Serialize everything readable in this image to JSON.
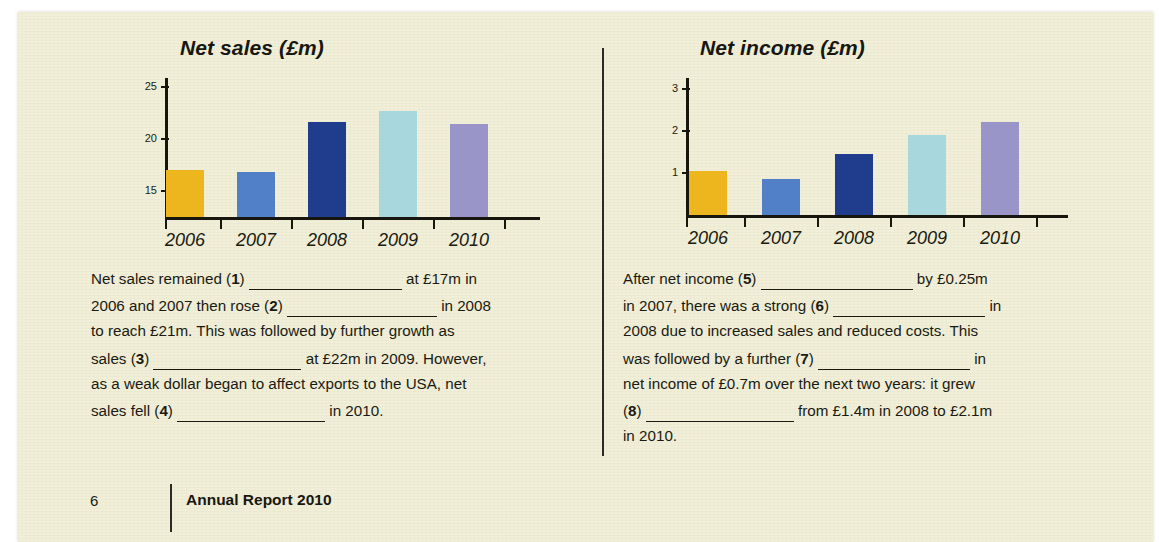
{
  "page": {
    "background_color": "#f1efd7",
    "footer": {
      "page_number": "6",
      "title": "Annual Report 2010"
    }
  },
  "palette": {
    "gold": "#edb61e",
    "blue": "#5180c8",
    "navy": "#1f3d8c",
    "cyan": "#a8d8de",
    "purple": "#9a95c8",
    "ink": "#16160f"
  },
  "chart_data": [
    {
      "type": "bar",
      "id": "net-sales",
      "title": "Net sales (£m)",
      "xlabel": "",
      "ylabel": "",
      "categories": [
        "2006",
        "2007",
        "2008",
        "2009",
        "2010"
      ],
      "values": [
        17.0,
        16.8,
        21.6,
        22.7,
        21.4
      ],
      "colors": [
        "#edb61e",
        "#5180c8",
        "#1f3d8c",
        "#a8d8de",
        "#9a95c8"
      ],
      "yticks": [
        15,
        20,
        25
      ],
      "ytick_labels": [
        "15",
        "20",
        "25"
      ],
      "ylim": [
        12.5,
        26.2
      ],
      "grid": false,
      "legend": "none"
    },
    {
      "type": "bar",
      "id": "net-income",
      "title": "Net income (£m)",
      "xlabel": "",
      "ylabel": "",
      "categories": [
        "2006",
        "2007",
        "2008",
        "2009",
        "2010"
      ],
      "values": [
        1.05,
        0.85,
        1.45,
        1.9,
        2.2
      ],
      "colors": [
        "#edb61e",
        "#5180c8",
        "#1f3d8c",
        "#a8d8de",
        "#9a95c8"
      ],
      "yticks": [
        1,
        2,
        3
      ],
      "ytick_labels": [
        "1",
        "2",
        "3"
      ],
      "ylim": [
        0,
        3.35
      ],
      "grid": false,
      "legend": "none"
    }
  ],
  "exercise": {
    "left_column": {
      "lines": [
        [
          {
            "t": "text",
            "v": "Net sales remained ("
          },
          {
            "t": "num",
            "v": "1"
          },
          {
            "t": "text",
            "v": ") "
          },
          {
            "t": "blank",
            "w": 153
          },
          {
            "t": "text",
            "v": " at £17m in"
          }
        ],
        [
          {
            "t": "text",
            "v": "2006 and 2007 then rose ("
          },
          {
            "t": "num",
            "v": "2"
          },
          {
            "t": "text",
            "v": ") "
          },
          {
            "t": "blank",
            "w": 150
          },
          {
            "t": "text",
            "v": " in 2008"
          }
        ],
        [
          {
            "t": "text",
            "v": "to reach £21m. This was followed by further growth as"
          }
        ],
        [
          {
            "t": "text",
            "v": "sales ("
          },
          {
            "t": "num",
            "v": "3"
          },
          {
            "t": "text",
            "v": ") "
          },
          {
            "t": "blank",
            "w": 148
          },
          {
            "t": "text",
            "v": " at £22m in 2009. However,"
          }
        ],
        [
          {
            "t": "text",
            "v": "as a weak dollar began to affect exports to the USA, net"
          }
        ],
        [
          {
            "t": "text",
            "v": "sales fell ("
          },
          {
            "t": "num",
            "v": "4"
          },
          {
            "t": "text",
            "v": ") "
          },
          {
            "t": "blank",
            "w": 148
          },
          {
            "t": "text",
            "v": " in 2010."
          }
        ]
      ]
    },
    "right_column": {
      "lines": [
        [
          {
            "t": "text",
            "v": "After net income ("
          },
          {
            "t": "num",
            "v": "5"
          },
          {
            "t": "text",
            "v": ") "
          },
          {
            "t": "blank",
            "w": 152
          },
          {
            "t": "text",
            "v": " by £0.25m"
          }
        ],
        [
          {
            "t": "text",
            "v": "in 2007, there was a strong ("
          },
          {
            "t": "num",
            "v": "6"
          },
          {
            "t": "text",
            "v": ") "
          },
          {
            "t": "blank",
            "w": 152
          },
          {
            "t": "text",
            "v": " in"
          }
        ],
        [
          {
            "t": "text",
            "v": "2008 due to increased sales and reduced costs. This"
          }
        ],
        [
          {
            "t": "text",
            "v": "was followed by a further ("
          },
          {
            "t": "num",
            "v": "7"
          },
          {
            "t": "text",
            "v": ") "
          },
          {
            "t": "blank",
            "w": 152
          },
          {
            "t": "text",
            "v": " in"
          }
        ],
        [
          {
            "t": "text",
            "v": "net income of £0.7m over the next two years: it grew"
          }
        ],
        [
          {
            "t": "text",
            "v": "("
          },
          {
            "t": "num",
            "v": "8"
          },
          {
            "t": "text",
            "v": ") "
          },
          {
            "t": "blank",
            "w": 148
          },
          {
            "t": "text",
            "v": " from £1.4m in 2008 to £2.1m"
          }
        ],
        [
          {
            "t": "text",
            "v": "in 2010."
          }
        ]
      ]
    }
  }
}
